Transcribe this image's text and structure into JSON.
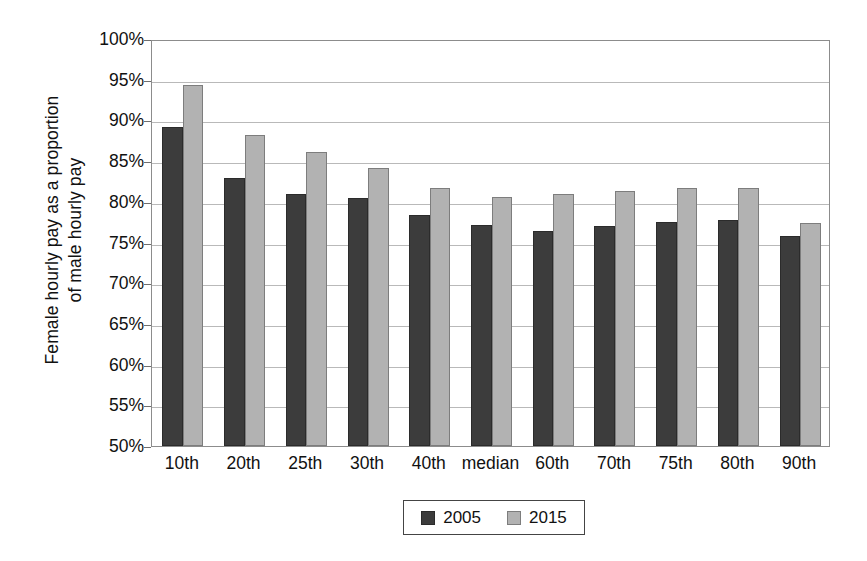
{
  "chart_data": {
    "type": "bar",
    "title": "",
    "xlabel": "",
    "ylabel": "Female hourly pay as a proportion of male hourly pay",
    "ylabel_lines": [
      "Female hourly pay as a proportion",
      "of male hourly pay"
    ],
    "categories": [
      "10th",
      "20th",
      "25th",
      "30th",
      "40th",
      "median",
      "60th",
      "70th",
      "75th",
      "80th",
      "90th"
    ],
    "series": [
      {
        "name": "2005",
        "color": "#3c3c3c",
        "values": [
          89.2,
          82.9,
          81.0,
          80.5,
          78.4,
          77.1,
          76.4,
          77.0,
          77.5,
          77.8,
          75.8
        ]
      },
      {
        "name": "2015",
        "color": "#b2b2b2",
        "values": [
          94.3,
          88.2,
          86.1,
          84.1,
          81.7,
          80.6,
          81.0,
          81.3,
          81.7,
          81.7,
          77.4
        ]
      }
    ],
    "ylim": [
      50,
      100
    ],
    "ytick_step": 5,
    "ytick_labels": [
      "100%",
      "95%",
      "90%",
      "85%",
      "80%",
      "75%",
      "70%",
      "65%",
      "60%",
      "55%",
      "50%"
    ],
    "ytick_values": [
      100,
      95,
      90,
      85,
      80,
      75,
      70,
      65,
      60,
      55,
      50
    ],
    "grid": true,
    "grid_axis": "y",
    "legend_position": "bottom",
    "legend_entries": [
      "2005",
      "2015"
    ]
  }
}
